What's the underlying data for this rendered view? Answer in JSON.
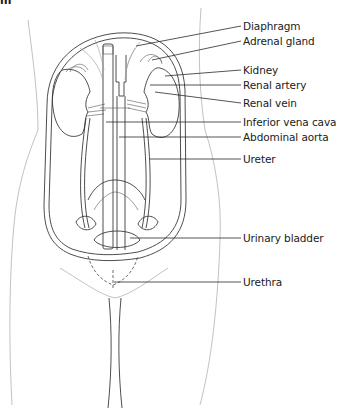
{
  "figure": {
    "title_fragment": "m",
    "labels": [
      {
        "id": "diaphragm",
        "text": "Diaphragm",
        "y": 26
      },
      {
        "id": "adrenal-gland",
        "text": "Adrenal gland",
        "y": 41
      },
      {
        "id": "kidney",
        "text": "Kidney",
        "y": 70
      },
      {
        "id": "renal-artery",
        "text": "Renal artery",
        "y": 85
      },
      {
        "id": "renal-vein",
        "text": "Renal vein",
        "y": 103
      },
      {
        "id": "inferior-vena-cava",
        "text": "Inferior vena cava",
        "y": 122
      },
      {
        "id": "abdominal-aorta",
        "text": "Abdominal aorta",
        "y": 137
      },
      {
        "id": "ureter",
        "text": "Ureter",
        "y": 159
      },
      {
        "id": "urinary-bladder",
        "text": "Urinary bladder",
        "y": 238
      },
      {
        "id": "urethra",
        "text": "Urethra",
        "y": 282
      }
    ],
    "colors": {
      "line": "#3a3a3a",
      "text": "#1a1a1a",
      "background": "#ffffff"
    }
  }
}
